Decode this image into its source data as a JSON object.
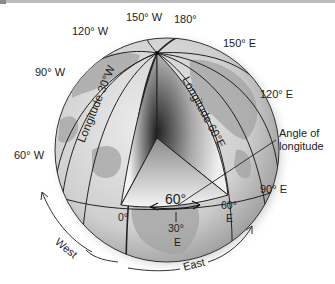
{
  "diagram": {
    "meridian_labels": {
      "w150": "150° W",
      "e180": "180°",
      "w120": "120° W",
      "e150": "150° E",
      "w90": "90° W",
      "e120": "120° E",
      "w60": "60° W",
      "e90": "90° E",
      "zero": "0°",
      "e60_top": "60°",
      "e60_bottom": "E",
      "e30_top": "30°",
      "e30_bottom": "E"
    },
    "curve_labels": {
      "longitude_30w": "Longitude 30°W",
      "longitude_60e": "Longitude 60°E"
    },
    "angle_label": "60°",
    "callout": {
      "line1": "Angle of",
      "line2": "longitude"
    },
    "direction_labels": {
      "west": "West",
      "east": "East"
    },
    "colors": {
      "ocean": "#d9d9d9",
      "land": "#9a9a9a",
      "line": "#222222",
      "wedge_dark": "#2a2a2a",
      "wedge_light": "#f4f4f4"
    }
  }
}
